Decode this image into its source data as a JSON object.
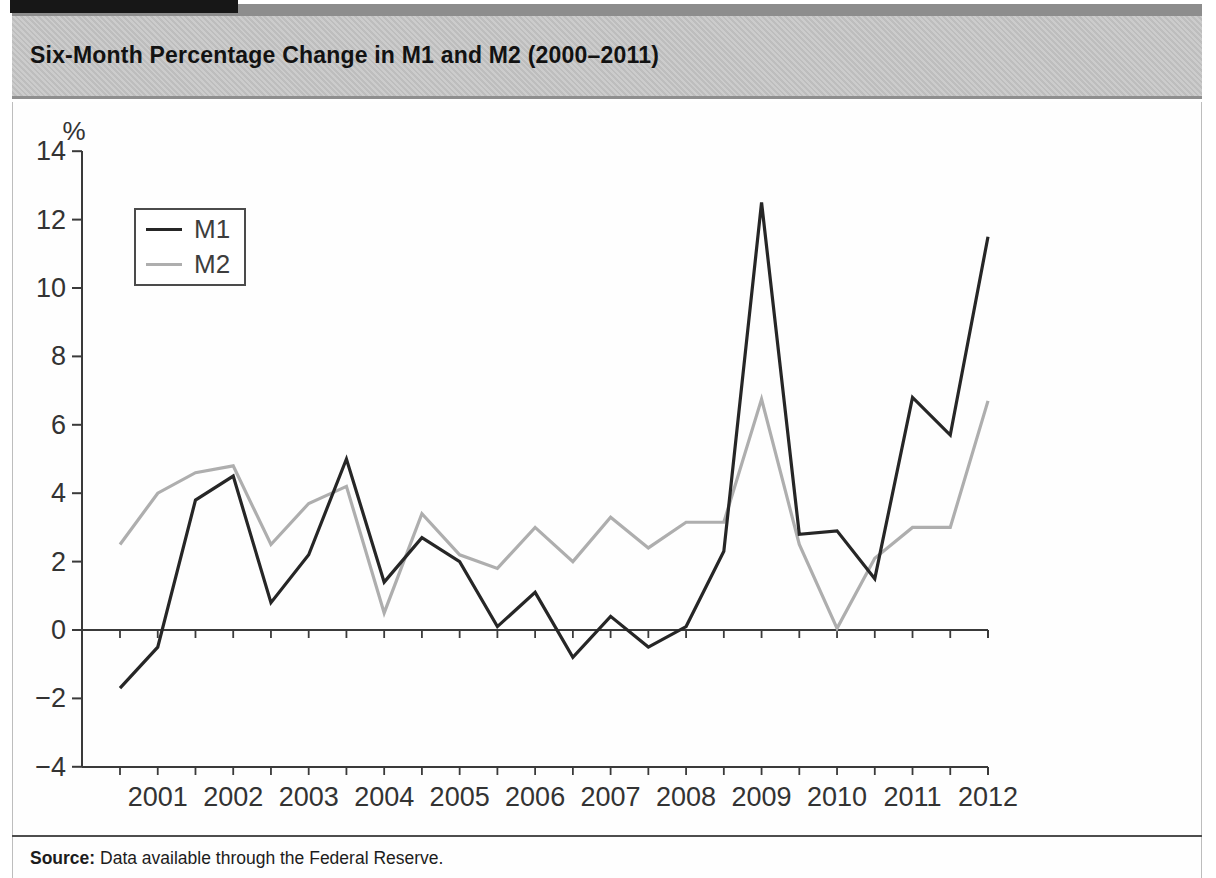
{
  "header": {
    "title": "Six-Month Percentage Change in M1 and M2 (2000–2011)"
  },
  "source": {
    "label": "Source:",
    "text": " Data available through the Federal Reserve."
  },
  "chart_data": {
    "type": "line",
    "title": "Six-Month Percentage Change in M1 and M2 (2000–2011)",
    "xlabel": "",
    "ylabel": "%",
    "ylim": [
      -4,
      14
    ],
    "ytick_step": 2,
    "yticks": [
      14,
      12,
      10,
      8,
      6,
      4,
      2,
      0,
      -2,
      -4
    ],
    "x_year_labels": [
      "2001",
      "2002",
      "2003",
      "2004",
      "2005",
      "2006",
      "2007",
      "2008",
      "2009",
      "2010",
      "2011",
      "2012"
    ],
    "x_frequency": "semiannual",
    "periods": [
      "2000-H2",
      "2001-H1",
      "2001-H2",
      "2002-H1",
      "2002-H2",
      "2003-H1",
      "2003-H2",
      "2004-H1",
      "2004-H2",
      "2005-H1",
      "2005-H2",
      "2006-H1",
      "2006-H2",
      "2007-H1",
      "2007-H2",
      "2008-H1",
      "2008-H2",
      "2009-H1",
      "2009-H2",
      "2010-H1",
      "2010-H2",
      "2011-H1",
      "2011-H2",
      "2012-H1"
    ],
    "series": [
      {
        "name": "M1",
        "color": "#262626",
        "values": [
          -1.7,
          -0.5,
          3.8,
          4.5,
          0.8,
          2.2,
          5.0,
          1.4,
          2.7,
          2.0,
          0.1,
          1.1,
          -0.8,
          0.4,
          -0.5,
          0.1,
          2.3,
          12.5,
          2.8,
          2.9,
          1.5,
          6.8,
          5.7,
          11.5
        ]
      },
      {
        "name": "M2",
        "color": "#aeaeae",
        "values": [
          2.5,
          4.0,
          4.6,
          4.8,
          2.5,
          3.7,
          4.2,
          0.5,
          3.4,
          2.2,
          1.8,
          3.0,
          2.0,
          3.3,
          2.4,
          3.15,
          3.15,
          6.75,
          2.5,
          0.05,
          2.1,
          3.0,
          3.0,
          6.7
        ]
      },
      {
        "name": "",
        "color": "",
        "values": []
      }
    ],
    "colors": {
      "axis": "#3a3a3a",
      "m1": "#262626",
      "m2": "#aeaeae"
    },
    "legend": {
      "position": "upper-left",
      "entries": [
        "M1",
        "M2"
      ]
    },
    "grid": false
  }
}
